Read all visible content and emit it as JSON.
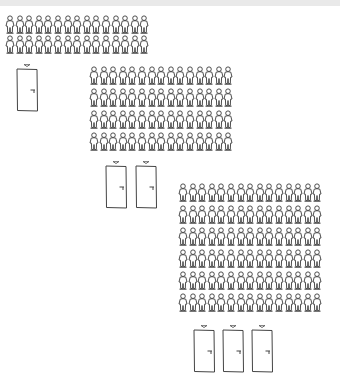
{
  "illustration": {
    "description": "Hand-drawn illustration of three groups of people queued in rows, each group with one, two, or three doors beneath it",
    "stroke_color": "#3a3a3a",
    "background": "#ffffff",
    "top_band_color": "#e9e9e9",
    "groups": [
      {
        "label": "group-1",
        "rows": 2,
        "people_per_row": 15,
        "crowd_x": 5,
        "crowd_y": 15,
        "row_spacing": 20,
        "doors": [
          {
            "x": 15,
            "y": 63
          }
        ]
      },
      {
        "label": "group-2",
        "rows": 4,
        "people_per_row": 15,
        "crowd_x": 89,
        "crowd_y": 66,
        "row_spacing": 22,
        "doors": [
          {
            "x": 104,
            "y": 160
          },
          {
            "x": 134,
            "y": 160
          }
        ]
      },
      {
        "label": "group-3",
        "rows": 6,
        "people_per_row": 15,
        "crowd_x": 178,
        "crowd_y": 183,
        "row_spacing": 22,
        "doors": [
          {
            "x": 192,
            "y": 324
          },
          {
            "x": 221,
            "y": 324
          },
          {
            "x": 250,
            "y": 324
          }
        ]
      }
    ]
  }
}
